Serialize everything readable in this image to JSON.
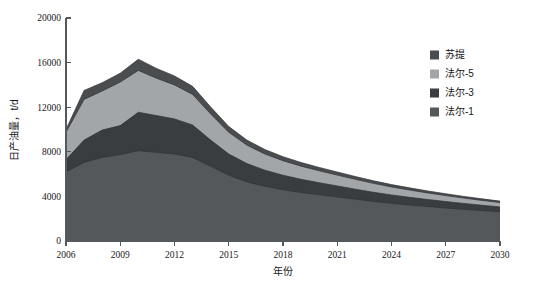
{
  "chart_data": {
    "type": "area",
    "stacked": true,
    "title": "",
    "xlabel": "年份",
    "ylabel": "日产油量，t/d",
    "xlim": [
      2006,
      2030
    ],
    "ylim": [
      0,
      20000
    ],
    "x": [
      2006,
      2007,
      2008,
      2009,
      2010,
      2011,
      2012,
      2013,
      2014,
      2015,
      2016,
      2017,
      2018,
      2019,
      2020,
      2021,
      2022,
      2023,
      2024,
      2025,
      2026,
      2027,
      2028,
      2029,
      2030
    ],
    "x_ticks": [
      2006,
      2009,
      2012,
      2015,
      2018,
      2021,
      2024,
      2027,
      2030
    ],
    "x_tick_labels": [
      "2006",
      "2009",
      "2012",
      "2015",
      "2018",
      "2021",
      "2024",
      "2027",
      "2030"
    ],
    "y_ticks": [
      0,
      4000,
      8000,
      12000,
      16000,
      20000
    ],
    "y_tick_labels": [
      "0",
      "4000",
      "8000",
      "12000",
      "16000",
      "20000"
    ],
    "grid": false,
    "legend_position": "right",
    "series": [
      {
        "name": "法尔-1",
        "color": "#55585b",
        "stack_order": 1,
        "values": [
          6200,
          7050,
          7500,
          7750,
          8100,
          7950,
          7800,
          7500,
          6700,
          5900,
          5300,
          4900,
          4600,
          4350,
          4150,
          3950,
          3750,
          3550,
          3380,
          3230,
          3090,
          2960,
          2840,
          2730,
          2620
        ]
      },
      {
        "name": "法尔-3",
        "color": "#3a3d40",
        "stack_order": 2,
        "values": [
          1100,
          2000,
          2450,
          2600,
          3450,
          3300,
          3150,
          2900,
          2350,
          1900,
          1650,
          1450,
          1300,
          1180,
          1080,
          990,
          900,
          820,
          750,
          690,
          630,
          580,
          530,
          480,
          440
        ]
      },
      {
        "name": "法尔-5",
        "color": "#a3a6a8",
        "stack_order": 3,
        "values": [
          2450,
          3650,
          3500,
          3900,
          3750,
          3350,
          3050,
          2750,
          2350,
          1950,
          1650,
          1450,
          1300,
          1180,
          1070,
          970,
          880,
          800,
          720,
          650,
          590,
          530,
          480,
          430,
          390
        ]
      },
      {
        "name": "苏提",
        "color": "#4a4d50",
        "stack_order": 4,
        "values": [
          250,
          800,
          750,
          800,
          1000,
          880,
          800,
          720,
          620,
          520,
          450,
          400,
          360,
          330,
          300,
          275,
          250,
          230,
          210,
          195,
          180,
          165,
          150,
          140,
          130
        ]
      }
    ],
    "legend_entries": [
      {
        "label": "苏提",
        "color": "#4a4d50"
      },
      {
        "label": "法尔-5",
        "color": "#a3a6a8"
      },
      {
        "label": "法尔-3",
        "color": "#3a3d40"
      },
      {
        "label": "法尔-1",
        "color": "#55585b"
      }
    ]
  }
}
